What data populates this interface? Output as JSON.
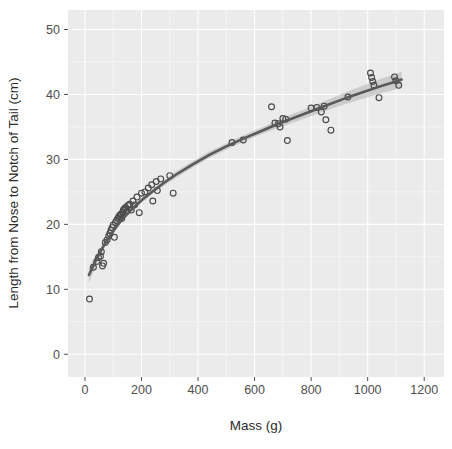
{
  "chart_data": {
    "type": "scatter",
    "title": "",
    "subtitle": "",
    "xlabel": "Mass (g)",
    "ylabel": "Length from Nose to Notch of Tail (cm)",
    "xlim": [
      -60,
      1270
    ],
    "ylim": [
      -3.5,
      53
    ],
    "xticks": [
      0,
      200,
      400,
      600,
      800,
      1000,
      1200
    ],
    "xtick_labels": [
      "0",
      "200",
      "400",
      "600",
      "800",
      "1000",
      "1200"
    ],
    "yticks": [
      0,
      10,
      20,
      30,
      40,
      50
    ],
    "ytick_labels": [
      "0",
      "10",
      "20",
      "30",
      "40",
      "50"
    ],
    "grid": true,
    "grid_color": "#ffffff",
    "panel_background": "#ebebeb",
    "legend": "none",
    "point_color": "#4a4a4a",
    "point_shape": "open-circle",
    "smooth": {
      "name": "loess-fit",
      "line_color": "#595959",
      "ribbon_color": "#b3b3b3",
      "ribbon_label": "95% confidence band",
      "x": [
        14,
        40,
        70,
        100,
        130,
        160,
        200,
        240,
        280,
        320,
        380,
        440,
        500,
        560,
        620,
        680,
        740,
        800,
        860,
        920,
        980,
        1040,
        1100,
        1120
      ],
      "y": [
        12.2,
        14.6,
        17.0,
        19.0,
        20.7,
        22.1,
        23.7,
        25.1,
        26.4,
        27.6,
        29.2,
        30.7,
        32.0,
        33.2,
        34.3,
        35.4,
        36.4,
        37.4,
        38.4,
        39.4,
        40.3,
        41.2,
        42.0,
        42.3
      ],
      "ymin": [
        11.0,
        13.8,
        16.5,
        18.6,
        20.3,
        21.7,
        23.3,
        24.7,
        26.0,
        27.1,
        28.7,
        30.2,
        31.5,
        32.7,
        33.8,
        34.8,
        35.7,
        36.7,
        37.6,
        38.5,
        39.3,
        40.1,
        40.8,
        41.1
      ],
      "ymax": [
        13.4,
        15.4,
        17.5,
        19.4,
        21.1,
        22.5,
        24.1,
        25.5,
        26.8,
        28.1,
        29.7,
        31.2,
        32.5,
        33.7,
        34.8,
        36.0,
        37.1,
        38.1,
        39.2,
        40.3,
        41.3,
        42.3,
        43.2,
        43.5
      ],
      "description": "Monotonic increasing saturating curve with narrow 95% confidence ribbon"
    },
    "points": [
      [
        16,
        8.5
      ],
      [
        30,
        13.4
      ],
      [
        42,
        14.3
      ],
      [
        48,
        14.9
      ],
      [
        55,
        15.1
      ],
      [
        58,
        15.8
      ],
      [
        62,
        13.6
      ],
      [
        66,
        14.0
      ],
      [
        72,
        17.2
      ],
      [
        78,
        17.6
      ],
      [
        84,
        18.2
      ],
      [
        88,
        18.6
      ],
      [
        92,
        19.1
      ],
      [
        96,
        19.5
      ],
      [
        100,
        19.9
      ],
      [
        104,
        18.0
      ],
      [
        108,
        20.3
      ],
      [
        112,
        20.6
      ],
      [
        116,
        20.9
      ],
      [
        120,
        21.2
      ],
      [
        124,
        21.4
      ],
      [
        128,
        21.6
      ],
      [
        130,
        20.9
      ],
      [
        134,
        21.9
      ],
      [
        136,
        22.2
      ],
      [
        140,
        22.4
      ],
      [
        144,
        22.6
      ],
      [
        148,
        22.0
      ],
      [
        152,
        22.9
      ],
      [
        158,
        23.1
      ],
      [
        164,
        22.2
      ],
      [
        170,
        23.6
      ],
      [
        176,
        23.0
      ],
      [
        184,
        24.2
      ],
      [
        192,
        21.8
      ],
      [
        200,
        24.8
      ],
      [
        212,
        25.0
      ],
      [
        224,
        25.6
      ],
      [
        236,
        26.1
      ],
      [
        240,
        23.6
      ],
      [
        252,
        26.6
      ],
      [
        256,
        25.2
      ],
      [
        268,
        27.0
      ],
      [
        300,
        27.5
      ],
      [
        312,
        24.8
      ],
      [
        520,
        32.6
      ],
      [
        560,
        33.0
      ],
      [
        660,
        38.1
      ],
      [
        672,
        35.6
      ],
      [
        684,
        35.5
      ],
      [
        690,
        35.0
      ],
      [
        700,
        36.3
      ],
      [
        710,
        36.2
      ],
      [
        716,
        32.9
      ],
      [
        800,
        37.9
      ],
      [
        820,
        38.0
      ],
      [
        836,
        37.3
      ],
      [
        846,
        38.2
      ],
      [
        852,
        36.1
      ],
      [
        870,
        34.5
      ],
      [
        930,
        39.6
      ],
      [
        1010,
        43.3
      ],
      [
        1014,
        42.6
      ],
      [
        1018,
        42.0
      ],
      [
        1022,
        41.4
      ],
      [
        1040,
        39.5
      ],
      [
        1095,
        42.7
      ],
      [
        1100,
        42.1
      ],
      [
        1110,
        41.4
      ]
    ]
  }
}
